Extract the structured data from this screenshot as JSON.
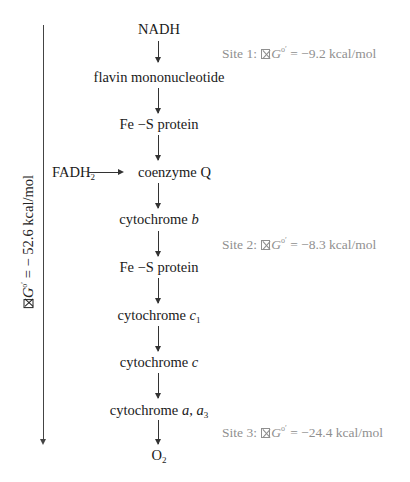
{
  "diagram": {
    "chain": [
      {
        "label": "NADH"
      },
      {
        "label": "flavin mononucleotide"
      },
      {
        "label": "Fe −S protein"
      },
      {
        "label": "coenzyme Q",
        "input": {
          "label": "FADH",
          "sub": "2"
        }
      },
      {
        "label": "cytochrome ",
        "italic": "b"
      },
      {
        "label": "Fe −S protein"
      },
      {
        "label": "cytochrome ",
        "italic": "c",
        "sub": "1"
      },
      {
        "label": "cytochrome ",
        "italic": "c"
      },
      {
        "label": "cytochrome ",
        "italic": "a",
        "mid": ", ",
        "italic2": "a",
        "sub": "3"
      },
      {
        "label": "O",
        "sub": "2"
      }
    ],
    "sites": [
      {
        "prefix": "Site 1: ",
        "symbol": "G",
        "sup": "o′",
        "eq": " = ",
        "value": "−9.2 kcal/mol"
      },
      {
        "prefix": "Site 2: ",
        "symbol": "G",
        "sup": "o′",
        "eq": " = ",
        "value": "−8.3 kcal/mol"
      },
      {
        "prefix": "Site 3: ",
        "symbol": "G",
        "sup": "o′",
        "eq": " = ",
        "value": "−24.4 kcal/mol"
      }
    ],
    "total": {
      "symbol": "G",
      "sup": "o′",
      "eq": " = ",
      "value": "− 52.6 kcal/mol"
    },
    "colors": {
      "text": "#1a1a1a",
      "site_text": "#8f8f8f",
      "arrow": "#333333"
    }
  }
}
